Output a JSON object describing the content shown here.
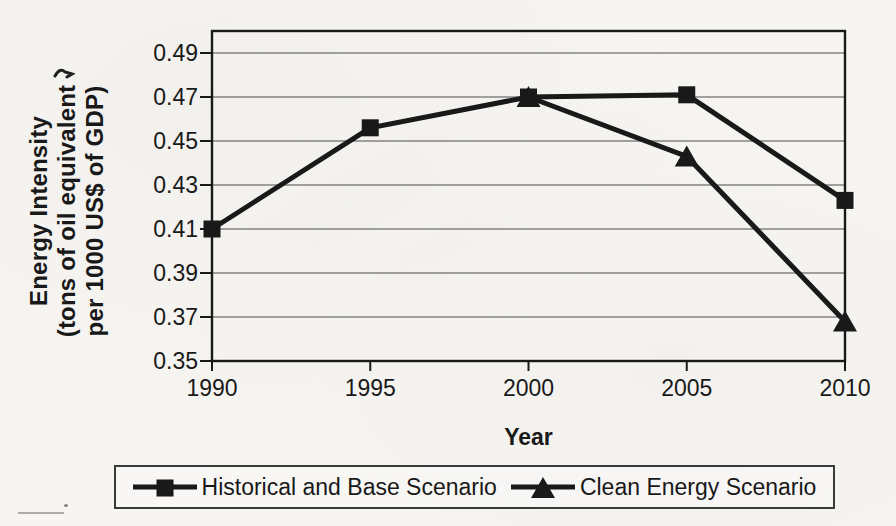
{
  "figure": {
    "paper_color": "#f7f5f2",
    "ink_color": "#191919",
    "grid_color": "#4d4d4d",
    "legend_border_color": "#3a3a3a"
  },
  "chart_data": {
    "type": "line",
    "title": "",
    "xlabel": "Year",
    "ylabel": "Energy Intensity\n(tons of oil equivalent\nper 1000 US$ of GDP)",
    "categories": [
      "1990",
      "1995",
      "2000",
      "2005",
      "2010"
    ],
    "x_range": [
      1990,
      2010
    ],
    "ylim": [
      0.35,
      0.5
    ],
    "y_tick_labels": [
      "0.35",
      "0.37",
      "0.39",
      "0.41",
      "0.43",
      "0.45",
      "0.47",
      "0.49"
    ],
    "grid": "horizontal gridlines on",
    "legend_position": "bottom",
    "series": [
      {
        "name": "Historical and Base Scenario",
        "marker": "square",
        "x": [
          1990,
          1995,
          2000,
          2005,
          2010
        ],
        "values": [
          0.41,
          0.456,
          0.47,
          0.471,
          0.423
        ]
      },
      {
        "name": "Clean Energy Scenario",
        "marker": "triangle",
        "x": [
          2000,
          2005,
          2010
        ],
        "values": [
          0.47,
          0.443,
          0.368
        ]
      }
    ]
  }
}
